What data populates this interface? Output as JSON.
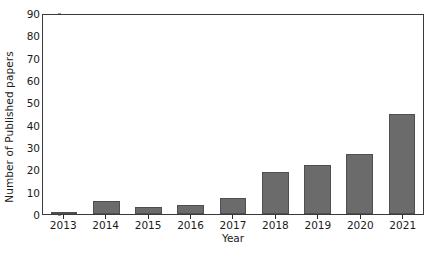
{
  "chart_data": {
    "type": "bar",
    "title": "",
    "xlabel": "Year",
    "ylabel": "Number of Published papers",
    "categories": [
      "2013",
      "2014",
      "2015",
      "2016",
      "2017",
      "2018",
      "2019",
      "2020",
      "2021"
    ],
    "values": [
      1,
      6,
      3,
      4,
      7,
      19,
      22,
      27,
      45
    ],
    "ylim": [
      0,
      90
    ],
    "yticks": [
      0,
      10,
      20,
      30,
      40,
      50,
      60,
      70,
      80,
      90
    ],
    "ytick_labels": [
      "0",
      "10",
      "20",
      "30",
      "40",
      "50",
      "60",
      "70",
      "80",
      "90"
    ],
    "grid": false,
    "legend": null,
    "bar_color": "#6b6b6b",
    "bar_edge_color": "#4f4f4f",
    "axes_color": "#3a3a3a",
    "background": "#ffffff",
    "series": [
      {
        "name": "Published papers",
        "values": [
          1,
          6,
          3,
          4,
          7,
          19,
          22,
          27,
          45
        ]
      }
    ]
  }
}
